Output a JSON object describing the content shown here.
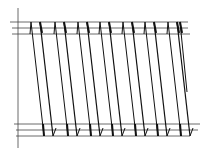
{
  "diagram": {
    "type": "zigzag-strokes-between-rails",
    "stroke_color": "#111111",
    "rail_color": "#444444",
    "axis": {
      "x": 18,
      "y1": 8,
      "y2": 148
    },
    "top_rails": [
      {
        "y": 22,
        "x1": 10,
        "x2": 188
      },
      {
        "y": 28,
        "x1": 12,
        "x2": 188
      },
      {
        "y": 34,
        "x1": 12,
        "x2": 190
      }
    ],
    "bottom_rails": [
      {
        "y": 124,
        "x1": 14,
        "x2": 200
      },
      {
        "y": 130,
        "x1": 16,
        "x2": 198
      },
      {
        "y": 136,
        "x1": 16,
        "x2": 190
      }
    ],
    "teeth_x": [
      31,
      55,
      78,
      100,
      123,
      145,
      168
    ],
    "top_y": 22,
    "bottom_y": 136,
    "slant": 13,
    "final_stroke": {
      "x1": 180,
      "y1": 22,
      "x2": 187,
      "y2": 92
    }
  }
}
